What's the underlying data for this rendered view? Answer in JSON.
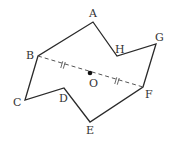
{
  "figure": {
    "type": "geometry",
    "colors": {
      "stroke": "#2a2a2a",
      "dashed": "#555555",
      "label": "#333333",
      "point": "#111111"
    },
    "vertices": [
      {
        "name": "A",
        "x": 93,
        "y": 22,
        "label_x": 89,
        "label_y": 17
      },
      {
        "name": "H",
        "x": 117,
        "y": 56,
        "label_x": 115,
        "label_y": 53
      },
      {
        "name": "G",
        "x": 156,
        "y": 44,
        "label_x": 155,
        "label_y": 41
      },
      {
        "name": "F",
        "x": 143,
        "y": 87,
        "label_x": 145,
        "label_y": 98
      },
      {
        "name": "E",
        "x": 90,
        "y": 122,
        "label_x": 86,
        "label_y": 134
      },
      {
        "name": "D",
        "x": 64,
        "y": 88,
        "label_x": 59,
        "label_y": 102
      },
      {
        "name": "C",
        "x": 25,
        "y": 100,
        "label_x": 13,
        "label_y": 106
      },
      {
        "name": "B",
        "x": 38,
        "y": 56,
        "label_x": 26,
        "label_y": 59
      }
    ],
    "center": {
      "name": "O",
      "x": 90,
      "y": 73,
      "label_x": 89,
      "label_y": 87
    },
    "dashed_segment": {
      "from": "B",
      "to": "F"
    },
    "equal_marks": [
      {
        "x": 63,
        "y": 65
      },
      {
        "x": 117,
        "y": 81
      }
    ]
  }
}
